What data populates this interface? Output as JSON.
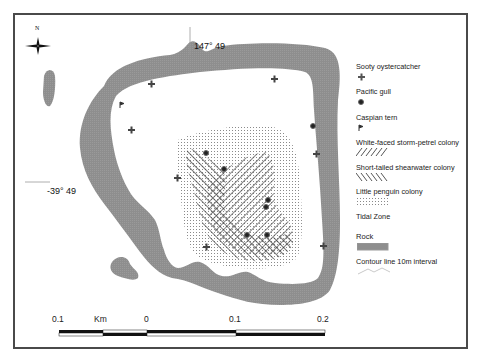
{
  "map": {
    "north_arrow": {
      "label": "N"
    },
    "coordinates": {
      "longitude_label": "147° 49",
      "latitude_label": "-39° 49"
    },
    "colors": {
      "rock": "#8f8f8f",
      "frame": "#4a4a4a",
      "hatch": "#333333",
      "dots": "#9a9a9a",
      "markers": "#333333"
    }
  },
  "legend": {
    "items": [
      {
        "label": "Sooty oystercatcher",
        "symbol": "plus-marker"
      },
      {
        "label": "Pacific gull",
        "symbol": "dot-marker"
      },
      {
        "label": "Caspian tern",
        "symbol": "flag-marker"
      },
      {
        "label": "White-faced storm-petrel colony",
        "symbol": "forward-hatch"
      },
      {
        "label": "Short-tailed shearwater colony",
        "symbol": "back-hatch"
      },
      {
        "label": "Little penguin colony",
        "symbol": "dot-pattern"
      },
      {
        "label": "Tidal Zone",
        "symbol": "none"
      },
      {
        "label": "Rock",
        "symbol": "grey-fill"
      },
      {
        "label": "Contour line 10m interval",
        "symbol": "contour-line"
      }
    ]
  },
  "scale_bar": {
    "unit": "Km",
    "labels": [
      "0.1",
      "0",
      "0.1",
      "0.2"
    ]
  }
}
